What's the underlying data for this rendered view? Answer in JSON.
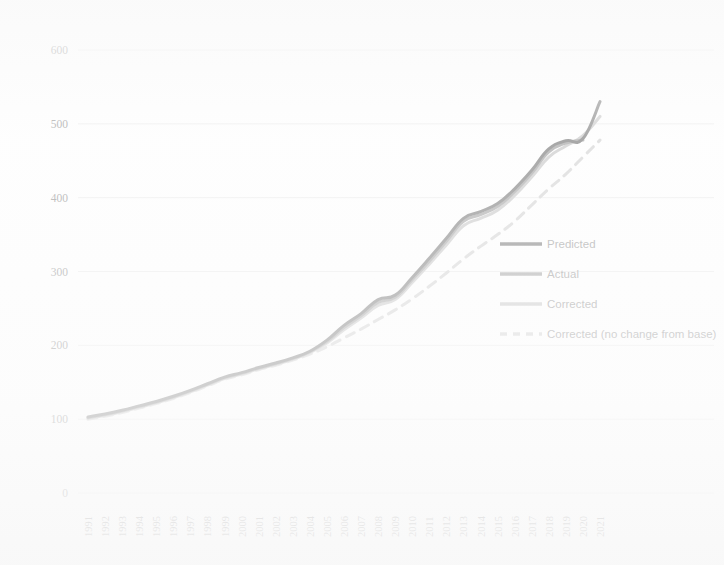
{
  "chart_data": {
    "type": "line",
    "title": "",
    "subtitle": "",
    "xlabel": "",
    "ylabel": "",
    "xlim": [
      1991,
      2021
    ],
    "ylim": [
      0,
      600
    ],
    "grid": true,
    "grid_axis": "y",
    "legend_position": "right-inside",
    "yticks": [
      0,
      100,
      200,
      300,
      400,
      500,
      600
    ],
    "ytick_labels": [
      "0",
      "100",
      "200",
      "300",
      "400",
      "500",
      "600"
    ],
    "categories": [
      "1991",
      "1992",
      "1993",
      "1994",
      "1995",
      "1996",
      "1997",
      "1998",
      "1999",
      "2000",
      "2001",
      "2002",
      "2003",
      "2004",
      "2005",
      "2006",
      "2007",
      "2008",
      "2009",
      "2010",
      "2011",
      "2012",
      "2013",
      "2014",
      "2015",
      "2016",
      "2017",
      "2018",
      "2019",
      "2020",
      "2021"
    ],
    "x": [
      1991,
      1992,
      1993,
      1994,
      1995,
      1996,
      1997,
      1998,
      1999,
      2000,
      2001,
      2002,
      2003,
      2004,
      2005,
      2006,
      2007,
      2008,
      2009,
      2010,
      2011,
      2012,
      2013,
      2014,
      2015,
      2016,
      2017,
      2018,
      2019,
      2020,
      2021
    ],
    "series": [
      {
        "name": "Predicted",
        "color": "#6e6e6e",
        "style": "solid",
        "width": 3.0,
        "values": [
          103,
          107,
          112,
          118,
          124,
          131,
          139,
          148,
          157,
          163,
          170,
          176,
          183,
          192,
          207,
          227,
          243,
          262,
          268,
          292,
          318,
          345,
          372,
          381,
          392,
          412,
          437,
          466,
          477,
          480,
          530
        ]
      },
      {
        "name": "Actual",
        "color": "#9a9a9a",
        "style": "solid",
        "width": 3.0,
        "values": [
          102,
          106,
          111,
          117,
          123,
          130,
          138,
          147,
          156,
          162,
          169,
          175,
          182,
          191,
          205,
          224,
          240,
          258,
          265,
          289,
          314,
          341,
          368,
          377,
          388,
          408,
          433,
          462,
          474,
          478,
          null
        ]
      },
      {
        "name": "Corrected",
        "color": "#c2c2c2",
        "style": "solid",
        "width": 3.0,
        "values": [
          101,
          105,
          110,
          116,
          122,
          129,
          137,
          146,
          155,
          161,
          168,
          174,
          181,
          190,
          203,
          221,
          237,
          254,
          262,
          285,
          310,
          336,
          362,
          372,
          383,
          403,
          428,
          455,
          470,
          484,
          510
        ]
      },
      {
        "name": "Corrected (no change from base)",
        "color": "#cfcfcf",
        "style": "dashed",
        "width": 3.0,
        "values": [
          100,
          104,
          109,
          115,
          121,
          128,
          136,
          145,
          154,
          160,
          167,
          173,
          180,
          188,
          198,
          210,
          222,
          235,
          248,
          263,
          280,
          298,
          317,
          334,
          350,
          368,
          390,
          412,
          432,
          455,
          478
        ]
      }
    ]
  },
  "legend": {
    "items": [
      {
        "label": "Predicted",
        "color": "#6e6e6e",
        "style": "solid"
      },
      {
        "label": "Actual",
        "color": "#9a9a9a",
        "style": "solid"
      },
      {
        "label": "Corrected",
        "color": "#c2c2c2",
        "style": "solid"
      },
      {
        "label": "Corrected (no change from base)",
        "color": "#cfcfcf",
        "style": "dashed"
      }
    ]
  },
  "colors": {
    "background": "#fdfdfd",
    "gridline": "#e9e9e9",
    "axis_text": "#8a8a8a",
    "predicted": "#6e6e6e",
    "actual": "#9a9a9a",
    "corrected": "#c2c2c2",
    "corrected_no_change": "#cfcfcf"
  }
}
